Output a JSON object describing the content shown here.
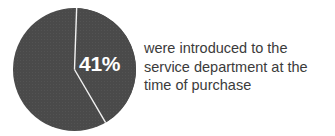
{
  "figure": {
    "background_color": "#ffffff",
    "width": 335,
    "height": 136
  },
  "pie": {
    "highlight_label": "41%",
    "slice_color": "#4a4a4a",
    "divider_color": "#f2f2f2",
    "label_color": "#ffffff"
  },
  "caption": {
    "color": "#3b3b3b",
    "line1": "were introduced to the",
    "line2": "service department at the",
    "line3": "time of purchase",
    "full_text": "were introduced to the service department at the time of purchase"
  },
  "chart_data": {
    "type": "pie",
    "title": "",
    "labels": [
      "were introduced to the service department at the time of purchase",
      "other"
    ],
    "values": [
      41,
      59
    ],
    "value_unit": "percent",
    "data_labels": [
      "41%",
      ""
    ],
    "colors": [
      "#4a4a4a",
      "#4a4a4a"
    ],
    "divider_color": "#f2f2f2",
    "start_angle_deg": 2,
    "legend": "none",
    "grid": false
  }
}
